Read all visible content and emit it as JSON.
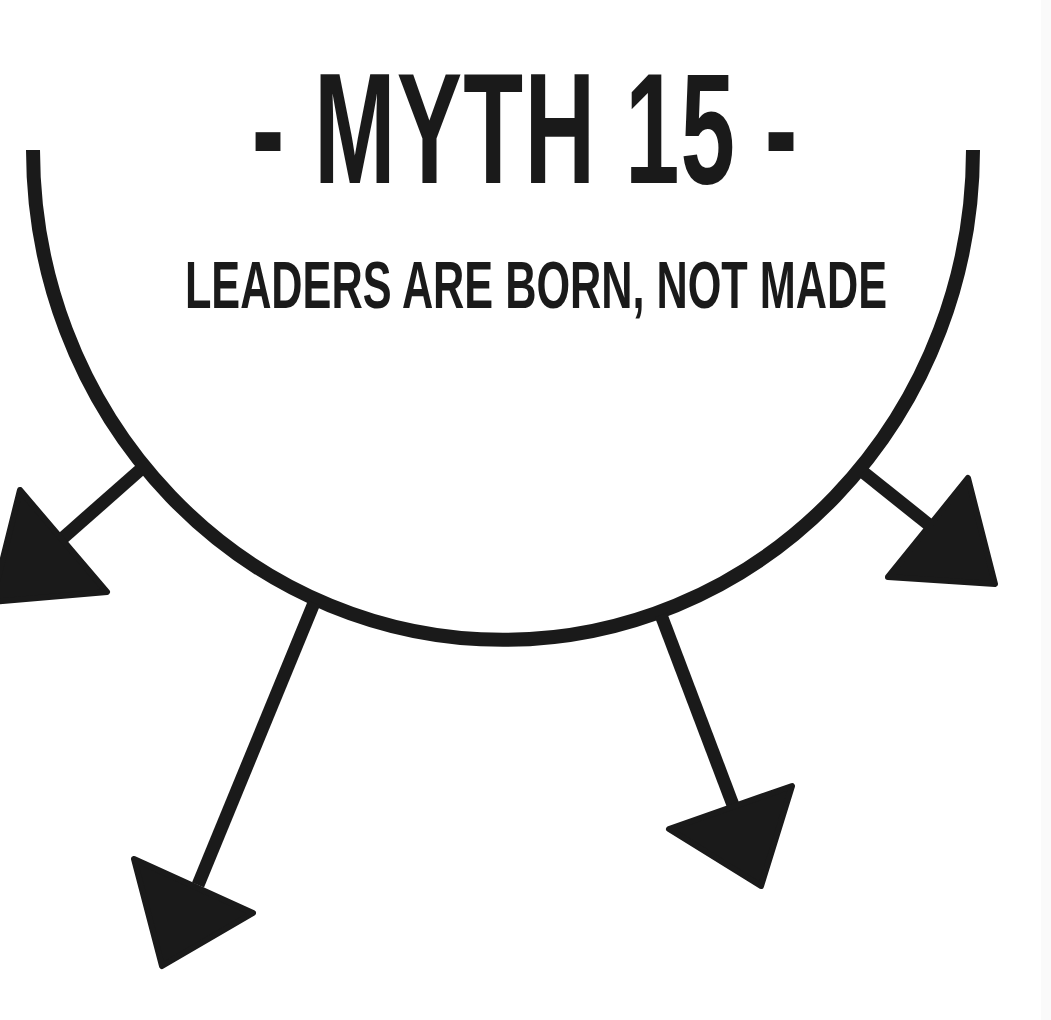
{
  "title": "- MYTH 15 -",
  "subtitle": "LEADERS ARE BORN, NOT MADE",
  "colors": {
    "ink": "#1a1a1a",
    "background": "#ffffff"
  },
  "diagram": {
    "shape": "semicircle-arc",
    "arrows": [
      {
        "name": "arrow-far-left",
        "direction": "down-left"
      },
      {
        "name": "arrow-lower-left",
        "direction": "down"
      },
      {
        "name": "arrow-lower-right",
        "direction": "down"
      },
      {
        "name": "arrow-far-right",
        "direction": "down-right"
      }
    ]
  }
}
